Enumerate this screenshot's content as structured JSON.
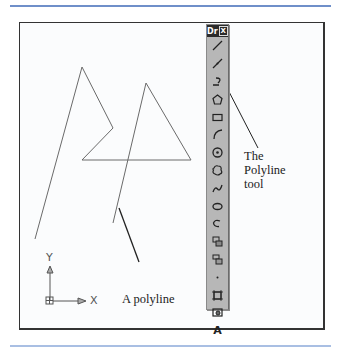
{
  "figure": {
    "callouts": {
      "tool_label": [
        "The",
        "Polyline",
        "tool"
      ],
      "polyline_label": "A polyline"
    },
    "ucs_icon": {
      "y_label": "Y",
      "x_label": "X"
    },
    "polyline_points": [
      [
        35,
        239
      ],
      [
        82,
        67
      ],
      [
        113,
        128
      ],
      [
        82,
        160
      ],
      [
        191,
        160
      ],
      [
        146,
        83
      ],
      [
        113,
        223
      ]
    ]
  },
  "toolbar": {
    "title": "Dr",
    "close_glyph": "X",
    "tools": [
      {
        "name": "line",
        "glyph": "line"
      },
      {
        "name": "construction-line",
        "glyph": "xline"
      },
      {
        "name": "polyline",
        "glyph": "pline"
      },
      {
        "name": "polygon",
        "glyph": "polygon"
      },
      {
        "name": "rectangle",
        "glyph": "rect"
      },
      {
        "name": "arc",
        "glyph": "arc"
      },
      {
        "name": "circle",
        "glyph": "circle"
      },
      {
        "name": "revision-cloud",
        "glyph": "cloud"
      },
      {
        "name": "spline",
        "glyph": "spline"
      },
      {
        "name": "ellipse",
        "glyph": "ellipse"
      },
      {
        "name": "ellipse-arc",
        "glyph": "ellarc"
      },
      {
        "name": "insert-block",
        "glyph": "insert"
      },
      {
        "name": "make-block",
        "glyph": "block"
      },
      {
        "name": "point",
        "glyph": "point"
      },
      {
        "name": "hatch",
        "glyph": "hatch"
      },
      {
        "name": "region",
        "glyph": "region"
      },
      {
        "name": "multiline-text",
        "glyph": "text"
      }
    ],
    "text_tool_label": "A"
  },
  "colors": {
    "rule": "#6f8fc9",
    "toolbar_bg": "#b7b7b7",
    "line": "#666666"
  }
}
